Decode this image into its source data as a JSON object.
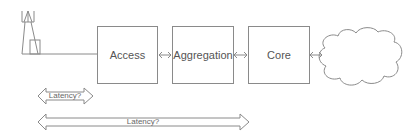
{
  "diagram": {
    "nodes": {
      "tower": {
        "label": "cell-tower"
      },
      "access": {
        "label": "Access"
      },
      "aggregation": {
        "label": "Aggregation"
      },
      "core": {
        "label": "Core"
      },
      "cloud": {
        "label": "cloud"
      }
    },
    "latency_short": {
      "label": "Latency?"
    },
    "latency_long": {
      "label": "Latency?"
    },
    "colors": {
      "stroke": "#8a8a8a",
      "text": "#555555"
    }
  }
}
